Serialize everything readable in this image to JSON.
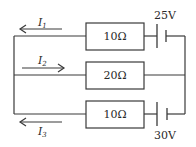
{
  "diagram": {
    "type": "circuit",
    "branches": [
      {
        "id": "top",
        "resistor": {
          "label": "10Ω",
          "value_ohm": 10
        },
        "battery": {
          "label": "25V",
          "voltage_v": 25
        },
        "current": {
          "symbol": "I",
          "subscript": "1",
          "direction": "left"
        }
      },
      {
        "id": "middle",
        "resistor": {
          "label": "20Ω",
          "value_ohm": 20
        },
        "battery": null,
        "current": {
          "symbol": "I",
          "subscript": "2",
          "direction": "right"
        }
      },
      {
        "id": "bottom",
        "resistor": {
          "label": "10Ω",
          "value_ohm": 10
        },
        "battery": {
          "label": "30V",
          "voltage_v": 30
        },
        "current": {
          "symbol": "I",
          "subscript": "3",
          "direction": "left"
        }
      }
    ]
  },
  "colors": {
    "line": "#3a3a3a",
    "text": "#2a2a2a",
    "background": "#ffffff"
  }
}
